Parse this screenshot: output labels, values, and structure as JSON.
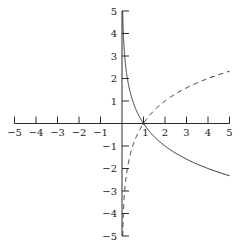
{
  "chart_data": {
    "type": "line",
    "title": "",
    "xlabel": "",
    "ylabel": "",
    "xlim": [
      -5,
      5
    ],
    "ylim": [
      -5,
      5
    ],
    "grid": false,
    "legend": null,
    "x_ticks": [
      -5,
      -4,
      -3,
      -2,
      -1,
      1,
      2,
      3,
      4,
      5
    ],
    "y_ticks": [
      -5,
      -4,
      -3,
      -2,
      -1,
      1,
      2,
      3,
      4,
      5
    ],
    "x_tick_labels": [
      "−5",
      "−4",
      "−3",
      "−2",
      "−1",
      "1",
      "2",
      "3",
      "4",
      "5"
    ],
    "y_tick_labels": [
      "−5",
      "−4",
      "−3",
      "−2",
      "−1",
      "1",
      "2",
      "3",
      "4",
      "5"
    ],
    "series": [
      {
        "name": "y = log_(1/2)(x)",
        "style": "solid",
        "x": [
          0.03125,
          0.0625,
          0.125,
          0.25,
          0.5,
          1,
          2,
          3,
          4,
          5
        ],
        "y": [
          5,
          4,
          3,
          2,
          1,
          0,
          -1,
          -1.585,
          -2,
          -2.322
        ]
      },
      {
        "name": "y = log_2(x)",
        "style": "dashed",
        "x": [
          0.03125,
          0.0625,
          0.125,
          0.25,
          0.5,
          1,
          2,
          3,
          4,
          5
        ],
        "y": [
          -5,
          -4,
          -3,
          -2,
          -1,
          0,
          1,
          1.585,
          2,
          2.322
        ]
      }
    ],
    "annotations": [
      {
        "type": "point",
        "x": 1,
        "y": 0,
        "label": "intersection at (1, 0)"
      }
    ]
  },
  "layout": {
    "origin_px": [
      122,
      123.5
    ],
    "x_unit_px": 21.5,
    "y_unit_px": 22.5,
    "stroke_color": "#2a2a2a"
  }
}
